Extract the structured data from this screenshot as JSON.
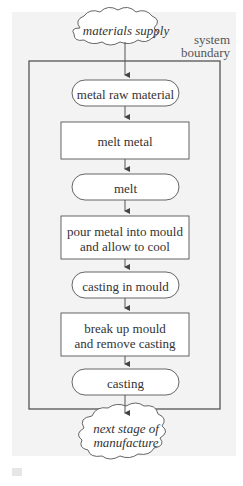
{
  "diagram": {
    "source": "materials supply",
    "boundary_label": [
      "system",
      "boundary"
    ],
    "sink": [
      "next stage of",
      "manufacture"
    ],
    "steps": [
      {
        "type": "material",
        "text": [
          "metal raw material"
        ]
      },
      {
        "type": "process",
        "text": [
          "melt metal"
        ]
      },
      {
        "type": "material",
        "text": [
          "melt"
        ]
      },
      {
        "type": "process",
        "text": [
          "pour metal into mould",
          "and allow to cool"
        ]
      },
      {
        "type": "material",
        "text": [
          "casting in mould"
        ]
      },
      {
        "type": "process",
        "text": [
          "break up mould",
          "and remove casting"
        ]
      },
      {
        "type": "material",
        "text": [
          "casting"
        ]
      }
    ]
  },
  "colors": {
    "line": "#555555",
    "background": "#f3f3f3",
    "box": "#ffffff"
  }
}
